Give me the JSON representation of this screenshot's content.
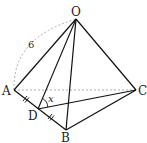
{
  "diagram": {
    "type": "tetrahedron",
    "vertices": {
      "O": {
        "label": "O",
        "x": 76,
        "y": 19
      },
      "A": {
        "label": "A",
        "x": 14,
        "y": 90
      },
      "B": {
        "label": "B",
        "x": 66,
        "y": 130
      },
      "C": {
        "label": "C",
        "x": 136,
        "y": 90
      },
      "D": {
        "label": "D",
        "x": 38,
        "y": 109
      }
    },
    "edge_length_label": "6",
    "angle_label": "x",
    "notes": {
      "hidden_edge": "AC (dashed)",
      "arc": "OA dashed arc labeled 6",
      "tick_marks": "AD = DB",
      "angle": "ODC marked x"
    },
    "colors": {
      "line": "#111111",
      "dashed": "#999999",
      "background": "#ffffff"
    }
  }
}
